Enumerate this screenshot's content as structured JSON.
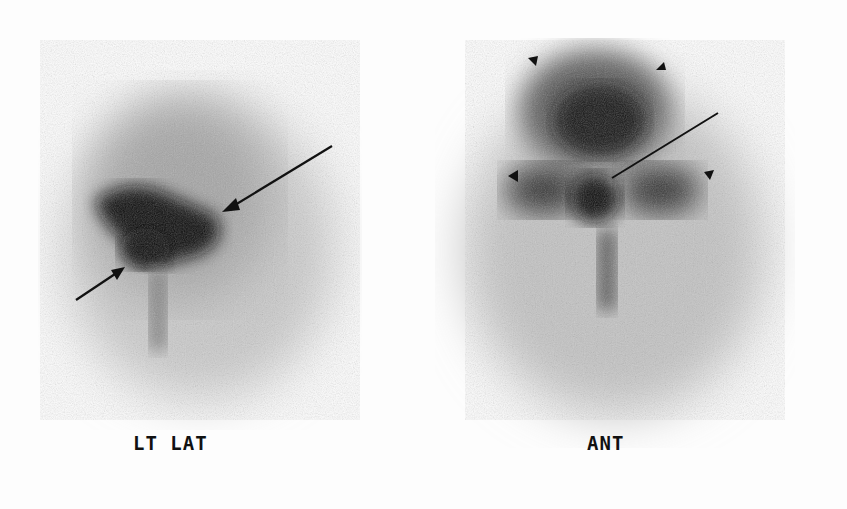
{
  "figure": {
    "panels": [
      {
        "id": "left",
        "label": "LT LAT",
        "view": "left lateral"
      },
      {
        "id": "right",
        "label": "ANT",
        "view": "anterior"
      }
    ],
    "annotations": {
      "left_arrows": 2,
      "right_long_pointer": 1,
      "right_arrowheads": 4
    },
    "colors": {
      "background": "#fdfdfd",
      "uptake_dark": "#0a0a0a",
      "uptake_mid": "#6a6a6a"
    }
  }
}
